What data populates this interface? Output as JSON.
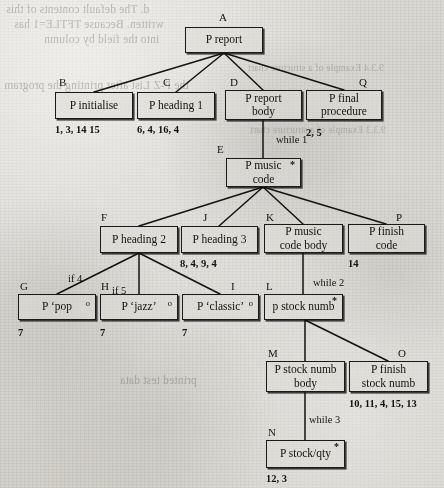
{
  "diagram": {
    "kind": "program-structure-tree",
    "page_background": "#d9d7d2",
    "ink_color": "#15120f",
    "nodes": [
      {
        "id": "A",
        "tag": "A",
        "label": "P  report",
        "sup": "",
        "x": 185,
        "y": 27,
        "w": 78,
        "h": 26,
        "tag_x": 219,
        "tag_y": 12
      },
      {
        "id": "B",
        "tag": "B",
        "label": "P  initialise",
        "sup": "",
        "x": 55,
        "y": 92,
        "w": 78,
        "h": 27,
        "tag_x": 59,
        "tag_y": 77
      },
      {
        "id": "C",
        "tag": "C",
        "label": "P  heading  1",
        "sup": "",
        "x": 137,
        "y": 92,
        "w": 78,
        "h": 27,
        "tag_x": 163,
        "tag_y": 77
      },
      {
        "id": "D",
        "tag": "D",
        "label": "P  report\nbody",
        "sup": "",
        "x": 225,
        "y": 90,
        "w": 77,
        "h": 30,
        "tag_x": 230,
        "tag_y": 77
      },
      {
        "id": "Q",
        "tag": "Q",
        "label": "P  final\nprocedure",
        "sup": "",
        "x": 306,
        "y": 90,
        "w": 76,
        "h": 30,
        "tag_x": 359,
        "tag_y": 77
      },
      {
        "id": "E",
        "tag": "E",
        "label": "P  music\ncode",
        "sup": "*",
        "x": 226,
        "y": 158,
        "w": 75,
        "h": 29,
        "tag_x": 217,
        "tag_y": 144
      },
      {
        "id": "F",
        "tag": "F",
        "label": "P  heading  2",
        "sup": "",
        "x": 100,
        "y": 226,
        "w": 78,
        "h": 27,
        "tag_x": 101,
        "tag_y": 212
      },
      {
        "id": "J",
        "tag": "J",
        "label": "P  heading  3",
        "sup": "",
        "x": 181,
        "y": 226,
        "w": 77,
        "h": 27,
        "tag_x": 203,
        "tag_y": 212
      },
      {
        "id": "K",
        "tag": "K",
        "label": "P  music\ncode body",
        "sup": "",
        "x": 264,
        "y": 224,
        "w": 79,
        "h": 29,
        "tag_x": 266,
        "tag_y": 212
      },
      {
        "id": "P",
        "tag": "P",
        "label": "P  finish\ncode",
        "sup": "",
        "x": 348,
        "y": 224,
        "w": 77,
        "h": 29,
        "tag_x": 396,
        "tag_y": 212
      },
      {
        "id": "G",
        "tag": "G",
        "label": "P  ‘pop",
        "sup": "o",
        "x": 18,
        "y": 294,
        "w": 78,
        "h": 26,
        "tag_x": 20,
        "tag_y": 281
      },
      {
        "id": "H",
        "tag": "H",
        "label": "P  ‘jazz’",
        "sup": "o",
        "x": 100,
        "y": 294,
        "w": 78,
        "h": 26,
        "tag_x": 101,
        "tag_y": 281
      },
      {
        "id": "I",
        "tag": "I",
        "label": "P  ‘classic’",
        "sup": "o",
        "x": 182,
        "y": 294,
        "w": 77,
        "h": 26,
        "tag_x": 231,
        "tag_y": 281
      },
      {
        "id": "L",
        "tag": "L",
        "label": "p  stock numb",
        "sup": "*",
        "x": 264,
        "y": 294,
        "w": 79,
        "h": 26,
        "tag_x": 266,
        "tag_y": 281
      },
      {
        "id": "M",
        "tag": "M",
        "label": "P  stock numb\nbody",
        "sup": "",
        "x": 266,
        "y": 361,
        "w": 79,
        "h": 31,
        "tag_x": 268,
        "tag_y": 348
      },
      {
        "id": "O",
        "tag": "O",
        "label": "P  finish\nstock numb",
        "sup": "",
        "x": 349,
        "y": 361,
        "w": 79,
        "h": 31,
        "tag_x": 398,
        "tag_y": 348
      },
      {
        "id": "N",
        "tag": "N",
        "label": "P  stock/qty",
        "sup": "*",
        "x": 266,
        "y": 440,
        "w": 79,
        "h": 28,
        "tag_x": 268,
        "tag_y": 427
      }
    ],
    "edge_labels": [
      {
        "text": "while 1",
        "x": 276,
        "y": 134
      },
      {
        "text": "while 2",
        "x": 313,
        "y": 277
      },
      {
        "text": "while 3",
        "x": 309,
        "y": 414
      },
      {
        "text": "if 4",
        "x": 68,
        "y": 273
      },
      {
        "text": "if 5",
        "x": 112,
        "y": 285
      }
    ],
    "leaf_numbers": [
      {
        "text": "1, 3, 14  15",
        "x": 55,
        "y": 124
      },
      {
        "text": "6, 4, 16, 4",
        "x": 137,
        "y": 124
      },
      {
        "text": "2, 5",
        "x": 306,
        "y": 127
      },
      {
        "text": "8, 4, 9, 4",
        "x": 180,
        "y": 258
      },
      {
        "text": "14",
        "x": 348,
        "y": 258
      },
      {
        "text": "7",
        "x": 18,
        "y": 327
      },
      {
        "text": "7",
        "x": 100,
        "y": 327
      },
      {
        "text": "7",
        "x": 182,
        "y": 327
      },
      {
        "text": "10, 11, 4, 15, 13",
        "x": 349,
        "y": 398
      },
      {
        "text": "12, 3",
        "x": 266,
        "y": 473
      }
    ],
    "edges": [
      {
        "from": "A",
        "to": "B",
        "x1": 224,
        "y1": 53,
        "x2": 94,
        "y2": 92
      },
      {
        "from": "A",
        "to": "C",
        "x1": 224,
        "y1": 53,
        "x2": 176,
        "y2": 92
      },
      {
        "from": "A",
        "to": "D",
        "x1": 224,
        "y1": 53,
        "x2": 263,
        "y2": 90
      },
      {
        "from": "A",
        "to": "Q",
        "x1": 224,
        "y1": 53,
        "x2": 344,
        "y2": 90
      },
      {
        "from": "D",
        "to": "E",
        "x1": 263,
        "y1": 120,
        "x2": 263,
        "y2": 158
      },
      {
        "from": "E",
        "to": "F",
        "x1": 263,
        "y1": 187,
        "x2": 139,
        "y2": 226
      },
      {
        "from": "E",
        "to": "J",
        "x1": 263,
        "y1": 187,
        "x2": 219,
        "y2": 226
      },
      {
        "from": "E",
        "to": "K",
        "x1": 263,
        "y1": 187,
        "x2": 303,
        "y2": 224
      },
      {
        "from": "E",
        "to": "P",
        "x1": 263,
        "y1": 187,
        "x2": 386,
        "y2": 224
      },
      {
        "from": "F",
        "to": "G",
        "x1": 139,
        "y1": 253,
        "x2": 57,
        "y2": 294
      },
      {
        "from": "F",
        "to": "H",
        "x1": 139,
        "y1": 253,
        "x2": 139,
        "y2": 294
      },
      {
        "from": "F",
        "to": "I",
        "x1": 139,
        "y1": 253,
        "x2": 220,
        "y2": 294
      },
      {
        "from": "K",
        "to": "L",
        "x1": 303,
        "y1": 253,
        "x2": 303,
        "y2": 294
      },
      {
        "from": "L",
        "to": "M",
        "x1": 305,
        "y1": 320,
        "x2": 305,
        "y2": 361
      },
      {
        "from": "L",
        "to": "O",
        "x1": 305,
        "y1": 320,
        "x2": 388,
        "y2": 361
      },
      {
        "from": "M",
        "to": "N",
        "x1": 305,
        "y1": 392,
        "x2": 305,
        "y2": 440
      }
    ],
    "bleed_through": [
      {
        "text": "d. The default contents of this",
        "x": 6,
        "y": 2,
        "size": "normal"
      },
      {
        "text": "written. Because TFTLE=1 has",
        "x": 14,
        "y": 17,
        "size": "normal"
      },
      {
        "text": "into the field by column",
        "x": 44,
        "y": 32,
        "size": "normal"
      },
      {
        "text": "the P-Z List after printing the program",
        "x": 4,
        "y": 78,
        "size": "normal"
      },
      {
        "text": "printed test data",
        "x": 120,
        "y": 373,
        "size": "normal"
      },
      {
        "text": "9.3.3 Example of a structure chart",
        "x": 250,
        "y": 124,
        "size": "small"
      },
      {
        "text": "9.3.4 Example of a structure chart",
        "x": 248,
        "y": 62,
        "size": "small"
      }
    ]
  }
}
